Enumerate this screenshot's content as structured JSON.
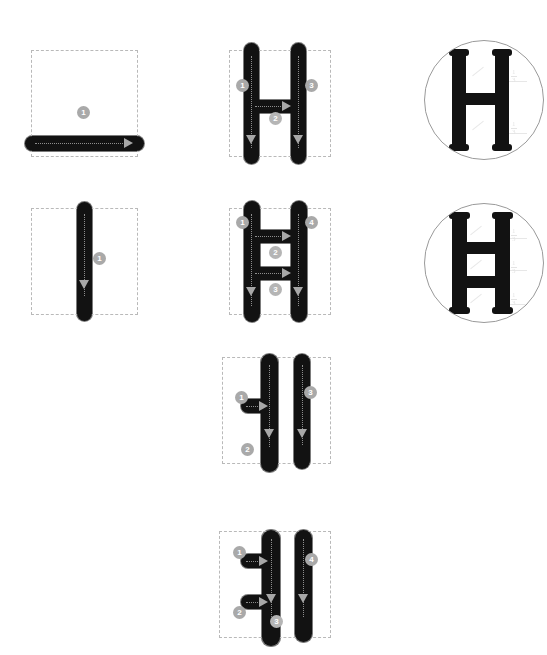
{
  "document": {
    "type": "stroke-order-chart",
    "background_color": "#ffffff",
    "ink_color": "#121212",
    "badge_color": "#a9a9a9",
    "arrow_color": "#a8a8a8",
    "guide_color": "#b9b9b9"
  },
  "diagrams": [
    {
      "id": "stroke-1-horizontal",
      "column": 1,
      "row": 1,
      "stroke_count": 1,
      "badges": [
        {
          "number": "1",
          "x": 83,
          "y": 112
        }
      ],
      "arrows": [
        {
          "direction": "right",
          "x": 124,
          "y": 92
        }
      ]
    },
    {
      "id": "stroke-1-vertical",
      "column": 1,
      "row": 2,
      "stroke_count": 1,
      "badges": [
        {
          "number": "1",
          "x": 99,
          "y": 252
        }
      ],
      "arrows": [
        {
          "direction": "down",
          "x": 79,
          "y": 280
        }
      ]
    },
    {
      "id": "letter-h-three-strokes",
      "column": 2,
      "row": 1,
      "stroke_count": 3,
      "badges": [
        {
          "number": "1",
          "x": 243,
          "y": 85
        },
        {
          "number": "2",
          "x": 276,
          "y": 118
        },
        {
          "number": "3",
          "x": 311,
          "y": 85
        }
      ],
      "arrows": [
        {
          "direction": "right",
          "x": 288,
          "y": 92
        },
        {
          "direction": "down",
          "x": 248,
          "y": 137
        },
        {
          "direction": "down",
          "x": 295,
          "y": 137
        }
      ]
    },
    {
      "id": "letter-h-four-strokes",
      "column": 2,
      "row": 2,
      "stroke_count": 4,
      "badges": [
        {
          "number": "1",
          "x": 243,
          "y": 222
        },
        {
          "number": "4",
          "x": 311,
          "y": 222
        },
        {
          "number": "2",
          "x": 276,
          "y": 252
        },
        {
          "number": "3",
          "x": 276,
          "y": 289
        }
      ],
      "arrows": [
        {
          "direction": "right",
          "x": 288,
          "y": 235
        },
        {
          "direction": "right",
          "x": 288,
          "y": 272
        },
        {
          "direction": "down",
          "x": 248,
          "y": 291
        },
        {
          "direction": "down",
          "x": 295,
          "y": 291
        }
      ]
    },
    {
      "id": "glyph-left-tick-three-strokes",
      "column": 2,
      "row": 3,
      "stroke_count": 3,
      "badges": [
        {
          "number": "1",
          "x": 242,
          "y": 398
        },
        {
          "number": "2",
          "x": 248,
          "y": 450
        },
        {
          "number": "3",
          "x": 311,
          "y": 393
        }
      ],
      "arrows": [
        {
          "direction": "right",
          "x": 262,
          "y": 406
        },
        {
          "direction": "down",
          "x": 265,
          "y": 434
        },
        {
          "direction": "down",
          "x": 291,
          "y": 434
        }
      ]
    },
    {
      "id": "glyph-left-tick-four-strokes",
      "column": 2,
      "row": 4,
      "stroke_count": 4,
      "badges": [
        {
          "number": "1",
          "x": 240,
          "y": 546
        },
        {
          "number": "2",
          "x": 240,
          "y": 606
        },
        {
          "number": "3",
          "x": 277,
          "y": 615
        },
        {
          "number": "4",
          "x": 312,
          "y": 553
        }
      ],
      "arrows": [
        {
          "direction": "right",
          "x": 259,
          "y": 556
        },
        {
          "direction": "right",
          "x": 259,
          "y": 597
        },
        {
          "direction": "down",
          "x": 268,
          "y": 594
        },
        {
          "direction": "down",
          "x": 293,
          "y": 594
        }
      ]
    }
  ],
  "medallions": [
    {
      "id": "medallion-h",
      "row": 1,
      "glyph": "H",
      "crossbars": 1,
      "fractions": [
        {
          "numerator": "1",
          "denominator": "3",
          "x": 68,
          "y": 28
        },
        {
          "numerator": "1",
          "denominator": "3",
          "x": 68,
          "y": 78
        }
      ]
    },
    {
      "id": "medallion-h-double",
      "row": 2,
      "glyph": "H",
      "crossbars": 2,
      "fractions": [
        {
          "numerator": "1",
          "denominator": "3",
          "x": 66,
          "y": 24
        },
        {
          "numerator": "1",
          "denominator": "3",
          "x": 66,
          "y": 54
        },
        {
          "numerator": "1",
          "denominator": "3",
          "x": 66,
          "y": 86
        }
      ]
    }
  ]
}
